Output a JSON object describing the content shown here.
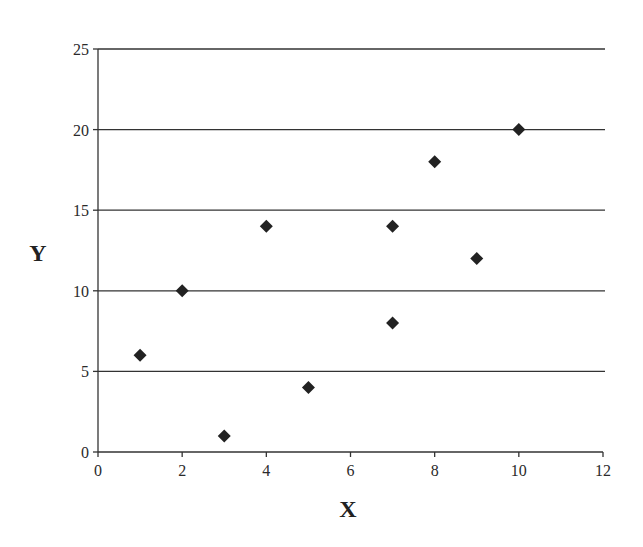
{
  "chart_data": {
    "type": "scatter",
    "title": "",
    "xlabel": "X",
    "ylabel": "Y",
    "xlim": [
      0,
      12
    ],
    "ylim": [
      0,
      25
    ],
    "x_ticks": [
      0,
      2,
      4,
      6,
      8,
      10,
      12
    ],
    "y_ticks": [
      0,
      5,
      10,
      15,
      20,
      25
    ],
    "grid": {
      "horizontal": true,
      "vertical": false
    },
    "legend": null,
    "marker": "diamond",
    "marker_color": "#222222",
    "series": [
      {
        "name": "data",
        "points": [
          {
            "x": 1,
            "y": 6
          },
          {
            "x": 2,
            "y": 10
          },
          {
            "x": 3,
            "y": 1
          },
          {
            "x": 4,
            "y": 14
          },
          {
            "x": 5,
            "y": 4
          },
          {
            "x": 7,
            "y": 14
          },
          {
            "x": 7,
            "y": 8
          },
          {
            "x": 8,
            "y": 18
          },
          {
            "x": 9,
            "y": 12
          },
          {
            "x": 10,
            "y": 20
          }
        ]
      }
    ]
  },
  "labels": {
    "x_axis": "X",
    "y_axis": "Y"
  }
}
